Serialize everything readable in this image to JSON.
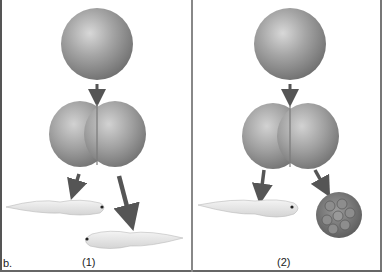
{
  "figure": {
    "part_label": "b.",
    "panels": [
      {
        "id": "1",
        "caption": "(1)",
        "stages": [
          "single-cell egg",
          "two-cell embryo"
        ],
        "outcomes": [
          "tadpole",
          "tadpole"
        ]
      },
      {
        "id": "2",
        "caption": "(2)",
        "stages": [
          "single-cell egg",
          "two-cell embryo"
        ],
        "outcomes": [
          "tadpole",
          "undifferentiated cell mass"
        ]
      }
    ]
  },
  "colors": {
    "border": "#555555",
    "arrow": "#555555",
    "sphere": "#9a9a9a",
    "tadpole": "#e8e8e8"
  }
}
